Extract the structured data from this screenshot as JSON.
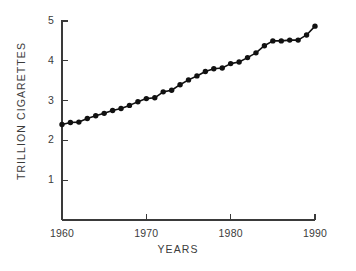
{
  "chart_data": {
    "type": "line",
    "title": "",
    "subtitle": "",
    "xlabel": "YEARS",
    "ylabel": "TRILLION CIGARETTES",
    "xlim": [
      1960,
      1990
    ],
    "ylim": [
      0,
      5
    ],
    "xticks": [
      1960,
      1970,
      1980,
      1990
    ],
    "xtick_labels": [
      "1960",
      "1970",
      "1980",
      "1990"
    ],
    "yticks": [
      1,
      2,
      3,
      4,
      5
    ],
    "ytick_labels": [
      "1",
      "2",
      "3",
      "4",
      "5"
    ],
    "grid": false,
    "legend": false,
    "legend_position": "none",
    "marker": "filled-circle",
    "marker_color": "#111111",
    "line_color": "#111111",
    "background_color": "#ffffff",
    "axis_color": "#3a3a3a",
    "x": [
      1960,
      1961,
      1962,
      1963,
      1964,
      1965,
      1966,
      1967,
      1968,
      1969,
      1970,
      1971,
      1972,
      1973,
      1974,
      1975,
      1976,
      1977,
      1978,
      1979,
      1980,
      1981,
      1982,
      1983,
      1984,
      1985
    ],
    "values": [
      2.4,
      2.45,
      2.47,
      2.55,
      2.6,
      2.68,
      2.73,
      2.8,
      2.85,
      2.95,
      3.05,
      3.1,
      3.25,
      3.27,
      3.4,
      3.5,
      3.6,
      3.72,
      3.8,
      3.82,
      3.92,
      3.95,
      4.07,
      4.1,
      4.32,
      4.47
    ],
    "series": [
      {
        "name": "World cigarette production",
        "values": [
          2.4,
          2.45,
          2.47,
          2.55,
          2.6,
          2.68,
          2.73,
          2.8,
          2.85,
          2.95,
          3.05,
          3.1,
          3.25,
          3.27,
          3.4,
          3.5,
          3.6,
          3.72,
          3.8,
          3.82,
          3.92,
          3.95,
          4.07,
          4.1,
          4.32,
          4.47
        ]
      }
    ],
    "points": [
      {
        "x": 1960,
        "y": 2.4
      },
      {
        "x": 1961,
        "y": 2.45
      },
      {
        "x": 1962,
        "y": 2.46
      },
      {
        "x": 1963,
        "y": 2.55
      },
      {
        "x": 1964,
        "y": 2.62
      },
      {
        "x": 1965,
        "y": 2.68
      },
      {
        "x": 1966,
        "y": 2.75
      },
      {
        "x": 1967,
        "y": 2.8
      },
      {
        "x": 1968,
        "y": 2.88
      },
      {
        "x": 1969,
        "y": 2.97
      },
      {
        "x": 1970,
        "y": 3.05
      },
      {
        "x": 1971,
        "y": 3.07
      },
      {
        "x": 1972,
        "y": 3.22
      },
      {
        "x": 1973,
        "y": 3.26
      },
      {
        "x": 1974,
        "y": 3.4
      },
      {
        "x": 1975,
        "y": 3.52
      },
      {
        "x": 1976,
        "y": 3.62
      },
      {
        "x": 1977,
        "y": 3.73
      },
      {
        "x": 1978,
        "y": 3.8
      },
      {
        "x": 1979,
        "y": 3.82
      },
      {
        "x": 1980,
        "y": 3.93
      },
      {
        "x": 1981,
        "y": 3.97
      },
      {
        "x": 1982,
        "y": 4.08
      },
      {
        "x": 1983,
        "y": 4.2
      },
      {
        "x": 1984,
        "y": 4.38
      },
      {
        "x": 1985,
        "y": 4.5
      },
      {
        "x": 1986,
        "y": 4.5
      },
      {
        "x": 1987,
        "y": 4.52
      },
      {
        "x": 1988,
        "y": 4.52
      },
      {
        "x": 1989,
        "y": 4.65
      },
      {
        "x": 1990,
        "y": 4.87
      }
    ]
  }
}
